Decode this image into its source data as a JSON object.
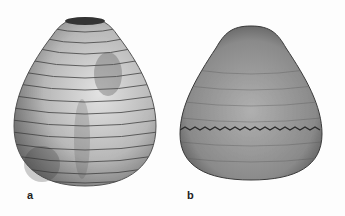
{
  "figure": {
    "panels": [
      {
        "label": "a",
        "description": "Lorica with widely spaced transverse ridges, light grey with dark shading"
      },
      {
        "label": "b",
        "description": "Lorica with fine striation and a serrated equatorial band, darker grey"
      }
    ],
    "colors": {
      "background": "#fdfdfd",
      "specimen_a": "#bdbdbd",
      "specimen_b": "#8a8a8a",
      "ink": "#222222"
    }
  }
}
